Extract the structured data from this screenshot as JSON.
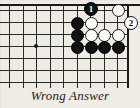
{
  "figure": {
    "kind": "go-board-diagram",
    "caption": "Wrong Answer"
  },
  "board": {
    "colors": {
      "background": "#efece5",
      "line": "#2b2b2b",
      "edge": "#1a1a1a",
      "black_stone": "#111111",
      "white_stone": "#fbfbf8"
    },
    "geometry": {
      "origin_x": 9,
      "origin_y": 10,
      "col_spacing": 13.5,
      "row_spacing": 12,
      "cols": 10,
      "rows": 7
    },
    "star_points": [
      {
        "name": "star-point",
        "x": 36,
        "y": 46
      }
    ],
    "edges": {
      "top_y": 4,
      "right_x": 127
    }
  },
  "stones": [
    {
      "name": "white-stone-r1c9",
      "color": "white",
      "x": 118,
      "y": 10
    },
    {
      "name": "black-stone-r2c6",
      "color": "black",
      "x": 77,
      "y": 23
    },
    {
      "name": "white-stone-r2c7",
      "color": "white",
      "x": 91,
      "y": 23
    },
    {
      "name": "black-stone-r3c6",
      "color": "black",
      "x": 77,
      "y": 35
    },
    {
      "name": "white-stone-r3c7",
      "color": "white",
      "x": 91,
      "y": 35
    },
    {
      "name": "white-stone-r3c8",
      "color": "white",
      "x": 104,
      "y": 35
    },
    {
      "name": "white-stone-r3c9",
      "color": "white",
      "x": 118,
      "y": 35
    },
    {
      "name": "black-stone-r4c6",
      "color": "black",
      "x": 77,
      "y": 47
    },
    {
      "name": "black-stone-r4c7",
      "color": "black",
      "x": 91,
      "y": 47
    },
    {
      "name": "black-stone-r4c8",
      "color": "black",
      "x": 104,
      "y": 47
    },
    {
      "name": "black-stone-r4c9",
      "color": "black",
      "x": 118,
      "y": 47
    }
  ],
  "moves": [
    {
      "name": "move-1-black",
      "label": "1",
      "color": "black",
      "x": 91,
      "y": 9
    },
    {
      "name": "move-2-white",
      "label": "2",
      "color": "white",
      "x": 131,
      "y": 23
    }
  ]
}
